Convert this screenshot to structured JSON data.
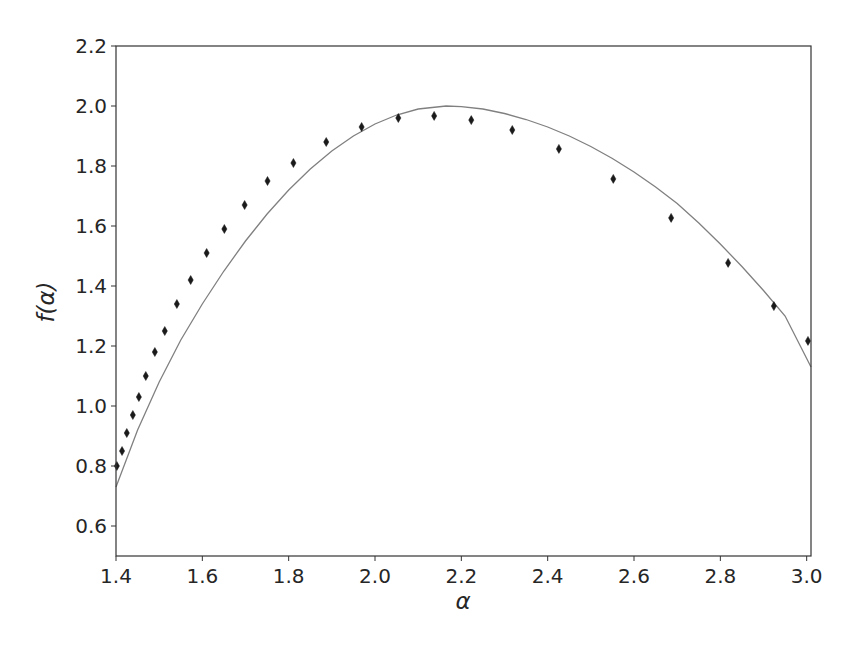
{
  "chart_data": {
    "type": "scatter",
    "title": "",
    "xlabel": "α",
    "ylabel": "f(α)",
    "xlim": [
      1.4,
      3.01
    ],
    "ylim": [
      0.5,
      2.2
    ],
    "grid": false,
    "legend": null,
    "xticks": [
      "1.4",
      "1.6",
      "1.8",
      "2.0",
      "2.2",
      "2.4",
      "2.6",
      "2.8",
      "3.0"
    ],
    "yticks": [
      "0.6",
      "0.8",
      "1.0",
      "1.2",
      "1.4",
      "1.6",
      "1.8",
      "2.0",
      "2.2"
    ],
    "series": [
      {
        "name": "data",
        "kind": "scatter",
        "marker": "thin-diamond",
        "color": "#1a1a1a",
        "x": [
          1.402,
          1.414,
          1.425,
          1.439,
          1.453,
          1.469,
          1.49,
          1.513,
          1.541,
          1.573,
          1.61,
          1.651,
          1.698,
          1.751,
          1.811,
          1.887,
          1.969,
          2.054,
          2.137,
          2.223,
          2.318,
          2.426,
          2.552,
          2.686,
          2.818,
          2.924,
          3.003
        ],
        "y": [
          0.8,
          0.85,
          0.91,
          0.97,
          1.03,
          1.1,
          1.18,
          1.25,
          1.34,
          1.42,
          1.51,
          1.59,
          1.67,
          1.75,
          1.81,
          1.88,
          1.93,
          1.96,
          1.967,
          1.953,
          1.92,
          1.857,
          1.757,
          1.627,
          1.477,
          1.333,
          1.217
        ]
      },
      {
        "name": "fit",
        "kind": "line",
        "color": "#808080",
        "x": [
          1.4,
          1.45,
          1.5,
          1.55,
          1.6,
          1.65,
          1.7,
          1.75,
          1.8,
          1.85,
          1.9,
          1.95,
          2.0,
          2.05,
          2.1,
          2.165,
          2.2,
          2.25,
          2.3,
          2.35,
          2.4,
          2.45,
          2.5,
          2.55,
          2.6,
          2.65,
          2.7,
          2.75,
          2.8,
          2.85,
          2.9,
          2.95,
          3.01
        ],
        "y": [
          0.73,
          0.92,
          1.08,
          1.22,
          1.34,
          1.45,
          1.55,
          1.64,
          1.72,
          1.79,
          1.85,
          1.9,
          1.94,
          1.97,
          1.99,
          2.0,
          1.998,
          1.99,
          1.975,
          1.955,
          1.93,
          1.9,
          1.865,
          1.825,
          1.78,
          1.73,
          1.675,
          1.61,
          1.54,
          1.465,
          1.385,
          1.3,
          1.13
        ]
      }
    ]
  }
}
